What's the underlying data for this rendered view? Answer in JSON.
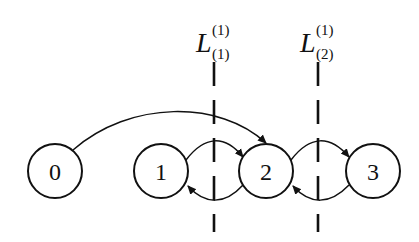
{
  "diagram": {
    "nodes": [
      {
        "id": "0",
        "label": "0",
        "cx": 55,
        "cy": 171
      },
      {
        "id": "1",
        "label": "1",
        "cx": 161,
        "cy": 171
      },
      {
        "id": "2",
        "label": "2",
        "cx": 266,
        "cy": 171
      },
      {
        "id": "3",
        "label": "3",
        "cx": 373,
        "cy": 171
      }
    ],
    "edges": [
      {
        "from": "0",
        "to": "2"
      },
      {
        "from": "1",
        "to": "2"
      },
      {
        "from": "2",
        "to": "1"
      },
      {
        "from": "2",
        "to": "3"
      },
      {
        "from": "3",
        "to": "2"
      }
    ],
    "cuts": [
      {
        "label_main": "L",
        "label_sup": "(1)",
        "label_sub": "(1)",
        "x": 214
      },
      {
        "label_main": "L",
        "label_sup": "(1)",
        "label_sub": "(2)",
        "x": 318
      }
    ],
    "stroke_color": "#111111"
  }
}
